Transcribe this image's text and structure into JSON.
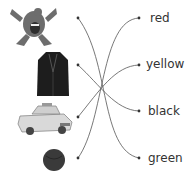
{
  "worksheet": {
    "pictures": [
      {
        "name": "monster",
        "description": "grey monster"
      },
      {
        "name": "jacket",
        "description": "black jacket"
      },
      {
        "name": "taxi",
        "description": "yellow taxi"
      },
      {
        "name": "ball",
        "description": "green ball"
      }
    ],
    "colors": [
      {
        "label": "red"
      },
      {
        "label": "yellow"
      },
      {
        "label": "black"
      },
      {
        "label": "green"
      }
    ],
    "matches": [
      {
        "from": "monster",
        "to": "green"
      },
      {
        "from": "jacket",
        "to": "black"
      },
      {
        "from": "taxi",
        "to": "yellow"
      },
      {
        "from": "ball",
        "to": "red"
      }
    ]
  }
}
